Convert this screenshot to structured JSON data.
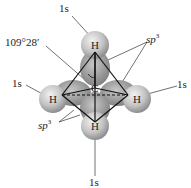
{
  "diagram": {
    "center_atom": "C",
    "atoms": [
      {
        "id": "top",
        "label": "H",
        "orbital": "1s"
      },
      {
        "id": "left",
        "label": "H",
        "orbital": "1s"
      },
      {
        "id": "right",
        "label": "H",
        "orbital": "1s"
      },
      {
        "id": "bottom",
        "label": "H",
        "orbital": "1s"
      }
    ],
    "labels": {
      "angle": "109°28′",
      "s_top": "1s",
      "s_left": "1s",
      "s_right": "1s",
      "s_bottom": "1s",
      "sp3_upper": "sp",
      "sp3_upper_sup": "3",
      "sp3_lower": "sp",
      "sp3_lower_sup": "3",
      "center": "C",
      "h": "H"
    },
    "colors": {
      "sphere": "#b8b8b8",
      "lobe": "#9a9a9a",
      "lines": "#111111",
      "text": "#222222"
    }
  }
}
